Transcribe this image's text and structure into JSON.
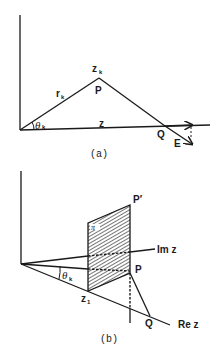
{
  "figure_a": {
    "caption": "(a)",
    "labels": {
      "zk": "z",
      "zk_sub": "k",
      "P": "P",
      "rk": "r",
      "rk_sub": "k",
      "theta": "θ",
      "theta_sub": "k",
      "z": "z",
      "Q": "Q",
      "E": "E"
    }
  },
  "figure_b": {
    "caption": "(b)",
    "labels": {
      "P_prime": "P′",
      "pi": "π",
      "Im_z": "Im z",
      "P": "P",
      "theta": "θ",
      "theta_sub": "k",
      "z1": "z",
      "z1_sub": "1",
      "Q": "Q",
      "Re_z": "Re z"
    }
  }
}
